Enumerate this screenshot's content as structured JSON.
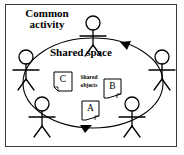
{
  "figure": {
    "type": "diagram",
    "title_label": "Common activity",
    "space_label": "Shared space",
    "objects_label": "Shared objects",
    "frame": {
      "border_color": "#3a3a3a",
      "background": "#ffffff"
    },
    "stroke_color": "#000000",
    "ellipse": {
      "name": "shared-space-ellipse",
      "cx": 93,
      "cy": 83,
      "rx": 70,
      "ry": 45,
      "direction": "clockwise",
      "arrowheads": 2
    },
    "actors": [
      {
        "name": "actor-top",
        "position": "top"
      },
      {
        "name": "actor-left",
        "position": "left"
      },
      {
        "name": "actor-right",
        "position": "right"
      },
      {
        "name": "actor-bottom-left",
        "position": "bottom-left"
      },
      {
        "name": "actor-bottom-right",
        "position": "bottom-right"
      }
    ],
    "documents": [
      {
        "name": "document-c",
        "label": "C",
        "fold": "bottom-left"
      },
      {
        "name": "document-b",
        "label": "B",
        "fold": "bottom-right"
      },
      {
        "name": "document-a",
        "label": "A",
        "fold": "bottom-right"
      }
    ]
  }
}
